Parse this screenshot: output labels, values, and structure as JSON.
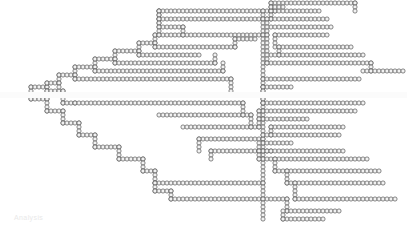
{
  "figure": {
    "title": "",
    "kind": "dendrogram",
    "marker": {
      "shape": "circle",
      "outline_color": "#555555",
      "fill_color": "#f2f2f2",
      "diameter_px": 4.2,
      "pitch_x_px": 4.0,
      "row_pitch_y_px": 8.0,
      "line_width_px": 0.7
    },
    "background_color": "#ffffff",
    "footer_note": "Analysis",
    "width_px": 407,
    "height_px": 229
  },
  "chart_data": {
    "type": "line",
    "title": "",
    "subtitle": "",
    "xlabel": "",
    "ylabel": "",
    "xlim": [
      0,
      407
    ],
    "ylim": [
      0,
      229
    ],
    "grid": false,
    "legend": null,
    "orientation": "horizontal-right",
    "root": {
      "x": 3,
      "y": 95
    },
    "segments": [
      {
        "id": "s01",
        "type": "h",
        "y": 95,
        "x1": 3,
        "x2": 31
      },
      {
        "id": "s02",
        "type": "v",
        "x": 31,
        "y1": 87,
        "y2": 99
      },
      {
        "id": "s03",
        "type": "h",
        "y": 87,
        "x1": 31,
        "x2": 47
      },
      {
        "id": "s04",
        "type": "h",
        "y": 99,
        "x1": 31,
        "x2": 47
      },
      {
        "id": "s05",
        "type": "v",
        "x": 47,
        "y1": 83,
        "y2": 91
      },
      {
        "id": "s06",
        "type": "h",
        "y": 83,
        "x1": 47,
        "x2": 59
      },
      {
        "id": "s07",
        "type": "h",
        "y": 91,
        "x1": 47,
        "x2": 63
      },
      {
        "id": "s08",
        "type": "v",
        "x": 47,
        "y1": 99,
        "y2": 111
      },
      {
        "id": "s09",
        "type": "h",
        "y": 111,
        "x1": 47,
        "x2": 63
      },
      {
        "id": "s10",
        "type": "v",
        "x": 59,
        "y1": 75,
        "y2": 87
      },
      {
        "id": "s11",
        "type": "h",
        "y": 75,
        "x1": 59,
        "x2": 75
      },
      {
        "id": "s12",
        "type": "v",
        "x": 63,
        "y1": 91,
        "y2": 103
      },
      {
        "id": "s13",
        "type": "h",
        "y": 103,
        "x1": 63,
        "x2": 75
      },
      {
        "id": "s14",
        "type": "v",
        "x": 63,
        "y1": 111,
        "y2": 123
      },
      {
        "id": "s15",
        "type": "h",
        "y": 123,
        "x1": 63,
        "x2": 79
      },
      {
        "id": "s16",
        "type": "v",
        "x": 75,
        "y1": 67,
        "y2": 79
      },
      {
        "id": "s17",
        "type": "h",
        "y": 67,
        "x1": 75,
        "x2": 95
      },
      {
        "id": "s18",
        "type": "h",
        "y": 79,
        "x1": 75,
        "x2": 231
      },
      {
        "id": "s19",
        "type": "h",
        "y": 103,
        "x1": 75,
        "x2": 243
      },
      {
        "id": "s20",
        "type": "v",
        "x": 79,
        "y1": 123,
        "y2": 135
      },
      {
        "id": "s21",
        "type": "h",
        "y": 135,
        "x1": 79,
        "x2": 95
      },
      {
        "id": "s22",
        "type": "v",
        "x": 95,
        "y1": 59,
        "y2": 71
      },
      {
        "id": "s23",
        "type": "h",
        "y": 59,
        "x1": 95,
        "x2": 115
      },
      {
        "id": "s24",
        "type": "h",
        "y": 71,
        "x1": 95,
        "x2": 223
      },
      {
        "id": "s25",
        "type": "v",
        "x": 95,
        "y1": 135,
        "y2": 147
      },
      {
        "id": "s26",
        "type": "h",
        "y": 147,
        "x1": 95,
        "x2": 119
      },
      {
        "id": "s27",
        "type": "v",
        "x": 115,
        "y1": 51,
        "y2": 63
      },
      {
        "id": "s28",
        "type": "h",
        "y": 51,
        "x1": 115,
        "x2": 139
      },
      {
        "id": "s29",
        "type": "h",
        "y": 63,
        "x1": 115,
        "x2": 215
      },
      {
        "id": "s30",
        "type": "v",
        "x": 119,
        "y1": 147,
        "y2": 159
      },
      {
        "id": "s31",
        "type": "h",
        "y": 159,
        "x1": 119,
        "x2": 143
      },
      {
        "id": "s32",
        "type": "v",
        "x": 139,
        "y1": 43,
        "y2": 55
      },
      {
        "id": "s33",
        "type": "h",
        "y": 43,
        "x1": 139,
        "x2": 155
      },
      {
        "id": "s34",
        "type": "h",
        "y": 55,
        "x1": 139,
        "x2": 199
      },
      {
        "id": "s35",
        "type": "v",
        "x": 143,
        "y1": 159,
        "y2": 171
      },
      {
        "id": "s36",
        "type": "h",
        "y": 171,
        "x1": 143,
        "x2": 155
      },
      {
        "id": "s37",
        "type": "v",
        "x": 155,
        "y1": 35,
        "y2": 47
      },
      {
        "id": "s38",
        "type": "h",
        "y": 35,
        "x1": 155,
        "x2": 267
      },
      {
        "id": "s39",
        "type": "h",
        "y": 47,
        "x1": 155,
        "x2": 235
      },
      {
        "id": "s40",
        "type": "v",
        "x": 155,
        "y1": 171,
        "y2": 183
      },
      {
        "id": "s41",
        "type": "h",
        "y": 183,
        "x1": 155,
        "x2": 263
      },
      {
        "id": "s42",
        "type": "v",
        "x": 155,
        "y1": 183,
        "y2": 191
      },
      {
        "id": "s43",
        "type": "h",
        "y": 191,
        "x1": 155,
        "x2": 171
      },
      {
        "id": "s44",
        "type": "v",
        "x": 159,
        "y1": 11,
        "y2": 23
      },
      {
        "id": "s45",
        "type": "h",
        "y": 11,
        "x1": 159,
        "x2": 275
      },
      {
        "id": "s46",
        "type": "h",
        "y": 19,
        "x1": 159,
        "x2": 267
      },
      {
        "id": "s47",
        "type": "h",
        "y": 27,
        "x1": 159,
        "x2": 183
      },
      {
        "id": "s48",
        "type": "v",
        "x": 159,
        "y1": 11,
        "y2": 35
      },
      {
        "id": "s49",
        "type": "h",
        "y": 115,
        "x1": 159,
        "x2": 251
      },
      {
        "id": "s50",
        "type": "v",
        "x": 171,
        "y1": 191,
        "y2": 199
      },
      {
        "id": "s51",
        "type": "h",
        "y": 199,
        "x1": 171,
        "x2": 287
      },
      {
        "id": "s52",
        "type": "h",
        "y": 127,
        "x1": 183,
        "x2": 259
      },
      {
        "id": "s53",
        "type": "h",
        "y": 139,
        "x1": 199,
        "x2": 263
      },
      {
        "id": "s54",
        "type": "h",
        "y": 151,
        "x1": 211,
        "x2": 271
      },
      {
        "id": "s55",
        "type": "v",
        "x": 231,
        "y1": 79,
        "y2": 95
      },
      {
        "id": "s56",
        "type": "h",
        "y": 95,
        "x1": 231,
        "x2": 263
      },
      {
        "id": "s57",
        "type": "v",
        "x": 263,
        "y1": 11,
        "y2": 219
      },
      {
        "id": "s58",
        "type": "h",
        "y": 3,
        "x1": 271,
        "x2": 355
      },
      {
        "id": "s59",
        "type": "h",
        "y": 11,
        "x1": 271,
        "x2": 319
      },
      {
        "id": "s60",
        "type": "v",
        "x": 271,
        "y1": 3,
        "y2": 19
      },
      {
        "id": "s61",
        "type": "h",
        "y": 19,
        "x1": 271,
        "x2": 327
      },
      {
        "id": "s62",
        "type": "h",
        "y": 27,
        "x1": 271,
        "x2": 331
      },
      {
        "id": "s63",
        "type": "h",
        "y": 35,
        "x1": 275,
        "x2": 327
      },
      {
        "id": "s64",
        "type": "v",
        "x": 275,
        "y1": 35,
        "y2": 47
      },
      {
        "id": "s65",
        "type": "h",
        "y": 47,
        "x1": 279,
        "x2": 351
      },
      {
        "id": "s66",
        "type": "v",
        "x": 279,
        "y1": 47,
        "y2": 55
      },
      {
        "id": "s67",
        "type": "h",
        "y": 55,
        "x1": 271,
        "x2": 363
      },
      {
        "id": "s68",
        "type": "h",
        "y": 63,
        "x1": 267,
        "x2": 371
      },
      {
        "id": "s69",
        "type": "v",
        "x": 371,
        "y1": 63,
        "y2": 71
      },
      {
        "id": "s70",
        "type": "h",
        "y": 71,
        "x1": 363,
        "x2": 403
      },
      {
        "id": "s71",
        "type": "h",
        "y": 79,
        "x1": 263,
        "x2": 359
      },
      {
        "id": "s72",
        "type": "h",
        "y": 87,
        "x1": 263,
        "x2": 291
      },
      {
        "id": "s73",
        "type": "h",
        "y": 95,
        "x1": 263,
        "x2": 355
      },
      {
        "id": "s74",
        "type": "h",
        "y": 103,
        "x1": 263,
        "x2": 363
      },
      {
        "id": "s75",
        "type": "h",
        "y": 111,
        "x1": 259,
        "x2": 355
      },
      {
        "id": "s76",
        "type": "h",
        "y": 119,
        "x1": 259,
        "x2": 307
      },
      {
        "id": "s77",
        "type": "h",
        "y": 127,
        "x1": 271,
        "x2": 343
      },
      {
        "id": "s78",
        "type": "v",
        "x": 271,
        "y1": 127,
        "y2": 135
      },
      {
        "id": "s79",
        "type": "h",
        "y": 135,
        "x1": 263,
        "x2": 339
      },
      {
        "id": "s80",
        "type": "h",
        "y": 143,
        "x1": 263,
        "x2": 291
      },
      {
        "id": "s81",
        "type": "h",
        "y": 151,
        "x1": 259,
        "x2": 343
      },
      {
        "id": "s82",
        "type": "h",
        "y": 159,
        "x1": 259,
        "x2": 367
      },
      {
        "id": "s83",
        "type": "v",
        "x": 275,
        "y1": 159,
        "y2": 171
      },
      {
        "id": "s84",
        "type": "h",
        "y": 171,
        "x1": 275,
        "x2": 379
      },
      {
        "id": "s85",
        "type": "v",
        "x": 287,
        "y1": 171,
        "y2": 183
      },
      {
        "id": "s86",
        "type": "h",
        "y": 183,
        "x1": 287,
        "x2": 383
      },
      {
        "id": "s87",
        "type": "v",
        "x": 295,
        "y1": 183,
        "y2": 199
      },
      {
        "id": "s88",
        "type": "h",
        "y": 199,
        "x1": 295,
        "x2": 395
      },
      {
        "id": "s89",
        "type": "v",
        "x": 287,
        "y1": 199,
        "y2": 211
      },
      {
        "id": "s90",
        "type": "h",
        "y": 211,
        "x1": 287,
        "x2": 339
      },
      {
        "id": "s91",
        "type": "h",
        "y": 219,
        "x1": 283,
        "x2": 323
      },
      {
        "id": "s92",
        "type": "v",
        "x": 283,
        "y1": 211,
        "y2": 219
      },
      {
        "id": "s93",
        "type": "v",
        "x": 263,
        "y1": 87,
        "y2": 103
      },
      {
        "id": "s94",
        "type": "v",
        "x": 259,
        "y1": 111,
        "y2": 127
      },
      {
        "id": "s95",
        "type": "v",
        "x": 259,
        "y1": 143,
        "y2": 159
      },
      {
        "id": "s96",
        "type": "v",
        "x": 267,
        "y1": 19,
        "y2": 63
      },
      {
        "id": "s97",
        "type": "v",
        "x": 243,
        "y1": 103,
        "y2": 115
      },
      {
        "id": "s98",
        "type": "v",
        "x": 251,
        "y1": 115,
        "y2": 127
      },
      {
        "id": "s99",
        "type": "v",
        "x": 215,
        "y1": 55,
        "y2": 63
      },
      {
        "id": "s100",
        "type": "v",
        "x": 223,
        "y1": 63,
        "y2": 71
      },
      {
        "id": "s101",
        "type": "v",
        "x": 235,
        "y1": 39,
        "y2": 47
      },
      {
        "id": "s102",
        "type": "h",
        "y": 39,
        "x1": 235,
        "x2": 255
      },
      {
        "id": "s103",
        "type": "v",
        "x": 199,
        "y1": 139,
        "y2": 151
      },
      {
        "id": "s104",
        "type": "v",
        "x": 211,
        "y1": 151,
        "y2": 159
      },
      {
        "id": "s105",
        "type": "v",
        "x": 183,
        "y1": 27,
        "y2": 35
      },
      {
        "id": "s106",
        "type": "v",
        "x": 355,
        "y1": 3,
        "y2": 11
      },
      {
        "id": "s107",
        "type": "h",
        "y": 7,
        "x1": 271,
        "x2": 283
      }
    ]
  }
}
